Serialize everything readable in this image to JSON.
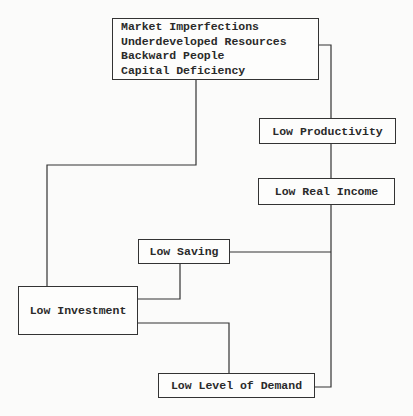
{
  "diagram": {
    "type": "vicious-circle-of-poverty",
    "nodes": [
      {
        "id": "causes",
        "lines": [
          "Market Imperfections",
          "Underdeveloped Resources",
          "Backward People",
          "Capital Deficiency"
        ]
      },
      {
        "id": "low-productivity",
        "label": "Low Productivity"
      },
      {
        "id": "low-real-income",
        "label": "Low Real Income"
      },
      {
        "id": "low-saving",
        "label": "Low Saving"
      },
      {
        "id": "low-investment",
        "label": "Low Investment"
      },
      {
        "id": "low-level-of-demand",
        "label": "Low Level of Demand"
      }
    ],
    "edges": [
      {
        "from": "causes",
        "to": "low-productivity"
      },
      {
        "from": "causes",
        "to": "low-investment"
      },
      {
        "from": "low-productivity",
        "to": "low-real-income"
      },
      {
        "from": "low-real-income",
        "to": "low-saving"
      },
      {
        "from": "low-real-income",
        "to": "low-level-of-demand"
      },
      {
        "from": "low-saving",
        "to": "low-investment"
      },
      {
        "from": "low-investment",
        "to": "low-level-of-demand"
      }
    ]
  }
}
